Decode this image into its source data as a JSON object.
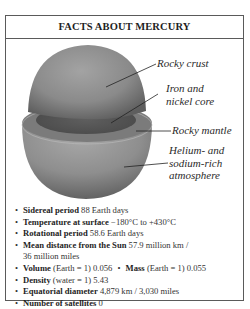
{
  "title": "FACTS ABOUT MERCURY",
  "diagram": {
    "icon": "mercury-cutaway-illustration",
    "labels": {
      "crust": [
        "Rocky crust"
      ],
      "core": [
        "Iron and",
        "nickel core"
      ],
      "mantle": [
        "Rocky mantle"
      ],
      "atmosphere": [
        "Helium- and",
        "sodium-rich",
        "atmosphere"
      ]
    },
    "colors": {
      "surface": "#8a8a8a",
      "core": "#555555",
      "mantle": "#7a7a7a"
    }
  },
  "bullet": "•",
  "facts": [
    {
      "label": "Sidereal period",
      "value": "88 Earth days"
    },
    {
      "label": "Temperature at surface",
      "value": " −180°C to +430°C"
    },
    {
      "label": "Rotational period",
      "value": "58.6 Earth days"
    },
    {
      "label": "Mean distance from the Sun",
      "value": "57.9 million km /",
      "value2": "36 million miles"
    },
    {
      "label": "Volume",
      "value": "(Earth = 1) 0.056",
      "label_b": "Mass",
      "value_b": "(Earth = 1) 0.055"
    },
    {
      "label": "Density",
      "value": "(water = 1) 5.43"
    },
    {
      "label": "Equatorial diameter",
      "value": "4,879 km / 3,030 miles"
    },
    {
      "label": "Number of satellites",
      "value": "0"
    }
  ]
}
